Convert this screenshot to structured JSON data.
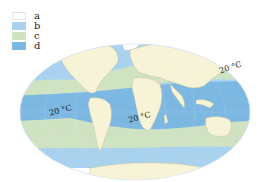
{
  "legend": {
    "items": [
      {
        "key": "a",
        "color": "#ffffff"
      },
      {
        "key": "b",
        "color": "#a9d2ee"
      },
      {
        "key": "c",
        "color": "#cfe3c2"
      },
      {
        "key": "d",
        "color": "#7db8e3"
      }
    ]
  },
  "isotherm_labels": [
    {
      "text": "20 °C",
      "position": "western Pacific"
    },
    {
      "text": "20 °C",
      "position": "South Pacific"
    },
    {
      "text": "20 °C",
      "position": "South Atlantic"
    }
  ],
  "colors": {
    "land": "#f6f3d6",
    "ocean_warm": "#7db8e3",
    "ocean_temperate": "#cfe3c2",
    "ocean_cold": "#a9d2ee",
    "ice": "#ffffff"
  }
}
